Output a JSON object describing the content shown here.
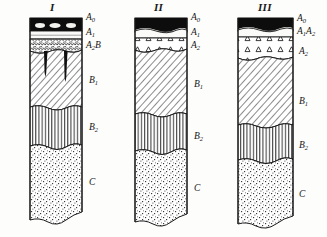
{
  "figure": {
    "type": "soil-profile-diagram",
    "background_color": "#fdfdfc",
    "ink_color": "#1a1a1a",
    "columns": [
      {
        "id": "profile-1",
        "numeral": "I",
        "x": 30,
        "width": 52,
        "top": 18,
        "bottom": 220,
        "horizons": [
          {
            "code": "A0",
            "label_main": "A",
            "label_sub": "0",
            "pattern": "solid-black-litter",
            "top": 18,
            "height": 13,
            "label_y": 16
          },
          {
            "code": "A1",
            "label_main": "A",
            "label_sub": "1",
            "pattern": "thin-pale-humus",
            "top": 31,
            "height": 8,
            "label_y": 29
          },
          {
            "code": "A2B",
            "label_main": "A",
            "label_sub": "2",
            "label_tail": "B",
            "pattern": "scaly-platy",
            "top": 39,
            "height": 14,
            "label_y": 41
          },
          {
            "code": "B1",
            "label_main": "B",
            "label_sub": "1",
            "pattern": "diagonal-hatch",
            "top": 53,
            "height": 54,
            "label_y": 76
          },
          {
            "code": "B2",
            "label_main": "B",
            "label_sub": "2",
            "pattern": "vertical-lines",
            "top": 107,
            "height": 42,
            "label_y": 123
          },
          {
            "code": "C",
            "label_main": "C",
            "label_sub": "",
            "pattern": "stipple-sand",
            "top": 149,
            "height": 71,
            "label_y": 178
          }
        ],
        "tongues": [
          {
            "x": 16,
            "top": 52,
            "depth": 25,
            "width": 7
          },
          {
            "x": 36,
            "top": 52,
            "depth": 30,
            "width": 7
          }
        ]
      },
      {
        "id": "profile-2",
        "numeral": "II",
        "x": 135,
        "width": 52,
        "top": 18,
        "bottom": 222,
        "horizons": [
          {
            "code": "A0",
            "label_main": "A",
            "label_sub": "0",
            "pattern": "solid-black-litter",
            "top": 18,
            "height": 14,
            "label_y": 16
          },
          {
            "code": "A1",
            "label_main": "A",
            "label_sub": "1",
            "pattern": "thin-pale-humus",
            "top": 32,
            "height": 6,
            "label_y": 29
          },
          {
            "code": "A2",
            "label_main": "A",
            "label_sub": "2",
            "pattern": "triangle-eluvial",
            "top": 38,
            "height": 14,
            "label_y": 41
          },
          {
            "code": "B1",
            "label_main": "B",
            "label_sub": "1",
            "pattern": "diagonal-hatch",
            "top": 52,
            "height": 62,
            "label_y": 80
          },
          {
            "code": "B2",
            "label_main": "B",
            "label_sub": "2",
            "pattern": "vertical-lines",
            "top": 114,
            "height": 39,
            "label_y": 132
          },
          {
            "code": "C",
            "label_main": "C",
            "label_sub": "",
            "pattern": "stipple-sand",
            "top": 153,
            "height": 69,
            "label_y": 184
          }
        ],
        "tongues": []
      },
      {
        "id": "profile-3",
        "numeral": "III",
        "x": 238,
        "width": 55,
        "top": 18,
        "bottom": 224,
        "horizons": [
          {
            "code": "A0",
            "label_main": "A",
            "label_sub": "0",
            "pattern": "solid-black-litter",
            "top": 18,
            "height": 13,
            "label_y": 17
          },
          {
            "code": "A1A2",
            "label_main": "A",
            "label_sub": "1",
            "label_main2": "A",
            "label_sub2": "2",
            "pattern": "thin-pale-humus",
            "top": 31,
            "height": 6,
            "label_y": 29
          },
          {
            "code": "A2",
            "label_main": "A",
            "label_sub": "2",
            "pattern": "triangle-eluvial",
            "top": 37,
            "height": 23,
            "label_y": 47
          },
          {
            "code": "B1",
            "label_main": "B",
            "label_sub": "1",
            "pattern": "diagonal-hatch",
            "top": 60,
            "height": 65,
            "label_y": 97
          },
          {
            "code": "B2",
            "label_main": "B",
            "label_sub": "2",
            "pattern": "vertical-lines",
            "top": 125,
            "height": 37,
            "label_y": 141
          },
          {
            "code": "C",
            "label_main": "C",
            "label_sub": "",
            "pattern": "stipple-sand",
            "top": 162,
            "height": 62,
            "label_y": 190
          }
        ],
        "tongues": []
      }
    ]
  }
}
